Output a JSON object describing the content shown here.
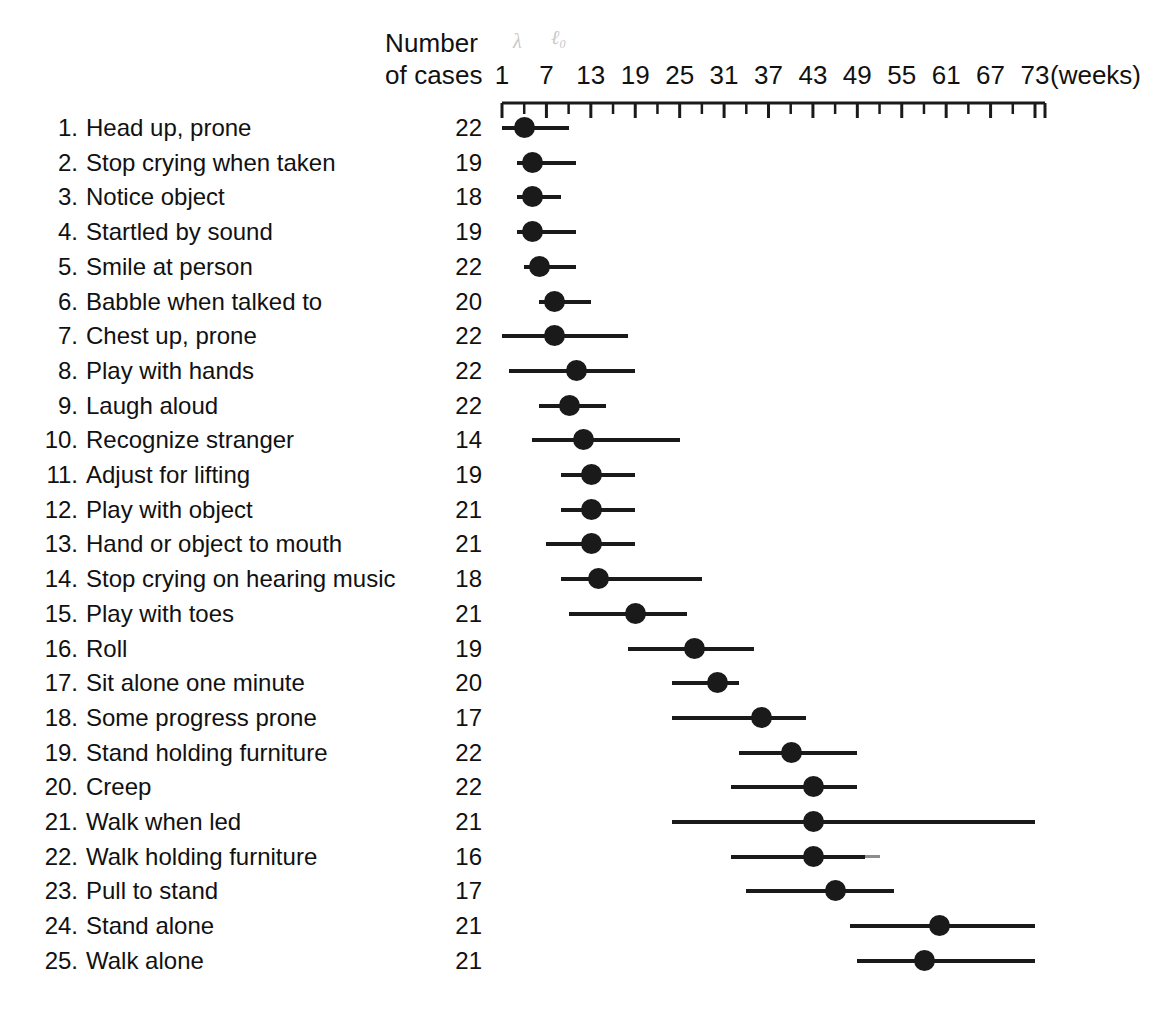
{
  "header": {
    "line1": "Number",
    "line2": "of cases",
    "unit": "(weeks)",
    "pencil_mark_1": "λ",
    "pencil_mark_2": "ℓ₀"
  },
  "axis": {
    "tick_labels": [
      "1",
      "7",
      "13",
      "19",
      "25",
      "31",
      "37",
      "43",
      "49",
      "55",
      "61",
      "67",
      "73"
    ],
    "tick_values": [
      1,
      7,
      13,
      19,
      25,
      31,
      37,
      43,
      49,
      55,
      61,
      67,
      73
    ],
    "minor_tick_step_weeks": 3,
    "axis_min_weeks": 1,
    "axis_max_weeks": 73,
    "axis_left_px": 502,
    "axis_right_px": 1035,
    "line_color": "#1a1a1a"
  },
  "caption_partial": "",
  "chart_data": {
    "type": "range-dot",
    "title": "",
    "xlabel": "(weeks)",
    "ylabel": "",
    "xlim": [
      1,
      75
    ],
    "grid": false,
    "legend": "none",
    "columns": [
      "No.",
      "Milestone",
      "Number of cases",
      "Range start (weeks)",
      "Median (weeks)",
      "Range end (weeks)"
    ],
    "rows": [
      {
        "num": "1.",
        "label": "Head up, prone",
        "cases": "22",
        "start": 1,
        "median": 4,
        "end": 10,
        "faded_tail": null
      },
      {
        "num": "2.",
        "label": "Stop crying when taken",
        "cases": "19",
        "start": 3,
        "median": 5,
        "end": 11,
        "faded_tail": null
      },
      {
        "num": "3.",
        "label": "Notice object",
        "cases": "18",
        "start": 3,
        "median": 5,
        "end": 9,
        "faded_tail": null
      },
      {
        "num": "4.",
        "label": "Startled by sound",
        "cases": "19",
        "start": 3,
        "median": 5,
        "end": 11,
        "faded_tail": null
      },
      {
        "num": "5.",
        "label": "Smile at person",
        "cases": "22",
        "start": 4,
        "median": 6,
        "end": 11,
        "faded_tail": null
      },
      {
        "num": "6.",
        "label": "Babble when talked to",
        "cases": "20",
        "start": 6,
        "median": 8,
        "end": 13,
        "faded_tail": null
      },
      {
        "num": "7.",
        "label": "Chest up, prone",
        "cases": "22",
        "start": 1,
        "median": 8,
        "end": 18,
        "faded_tail": null
      },
      {
        "num": "8.",
        "label": "Play with hands",
        "cases": "22",
        "start": 2,
        "median": 11,
        "end": 19,
        "faded_tail": null
      },
      {
        "num": "9.",
        "label": "Laugh aloud",
        "cases": "22",
        "start": 6,
        "median": 10,
        "end": 15,
        "faded_tail": null
      },
      {
        "num": "10.",
        "label": "Recognize stranger",
        "cases": "14",
        "start": 5,
        "median": 12,
        "end": 25,
        "faded_tail": null
      },
      {
        "num": "11.",
        "label": "Adjust for lifting",
        "cases": "19",
        "start": 9,
        "median": 13,
        "end": 19,
        "faded_tail": null
      },
      {
        "num": "12.",
        "label": "Play with object",
        "cases": "21",
        "start": 9,
        "median": 13,
        "end": 19,
        "faded_tail": null
      },
      {
        "num": "13.",
        "label": "Hand or object to mouth",
        "cases": "21",
        "start": 7,
        "median": 13,
        "end": 19,
        "faded_tail": null
      },
      {
        "num": "14.",
        "label": "Stop crying on hearing music",
        "cases": "18",
        "start": 9,
        "median": 14,
        "end": 28,
        "faded_tail": null
      },
      {
        "num": "15.",
        "label": "Play with toes",
        "cases": "21",
        "start": 10,
        "median": 19,
        "end": 26,
        "faded_tail": null
      },
      {
        "num": "16.",
        "label": "Roll",
        "cases": "19",
        "start": 18,
        "median": 27,
        "end": 35,
        "faded_tail": null
      },
      {
        "num": "17.",
        "label": "Sit alone one minute",
        "cases": "20",
        "start": 24,
        "median": 30,
        "end": 33,
        "faded_tail": null
      },
      {
        "num": "18.",
        "label": "Some progress prone",
        "cases": "17",
        "start": 24,
        "median": 36,
        "end": 42,
        "faded_tail": null
      },
      {
        "num": "19.",
        "label": "Stand holding furniture",
        "cases": "22",
        "start": 33,
        "median": 40,
        "end": 49,
        "faded_tail": null
      },
      {
        "num": "20.",
        "label": "Creep",
        "cases": "22",
        "start": 32,
        "median": 43,
        "end": 49,
        "faded_tail": null
      },
      {
        "num": "21.",
        "label": "Walk when led",
        "cases": "21",
        "start": 24,
        "median": 43,
        "end": 73,
        "faded_tail": null
      },
      {
        "num": "22.",
        "label": "Walk holding furniture",
        "cases": "16",
        "start": 32,
        "median": 43,
        "end": 50,
        "faded_tail": 52
      },
      {
        "num": "23.",
        "label": "Pull to stand",
        "cases": "17",
        "start": 34,
        "median": 46,
        "end": 54,
        "faded_tail": null
      },
      {
        "num": "24.",
        "label": "Stand alone",
        "cases": "21",
        "start": 48,
        "median": 60,
        "end": 73,
        "faded_tail": null
      },
      {
        "num": "25.",
        "label": "Walk alone",
        "cases": "21",
        "start": 49,
        "median": 58,
        "end": 73,
        "faded_tail": null
      }
    ]
  }
}
